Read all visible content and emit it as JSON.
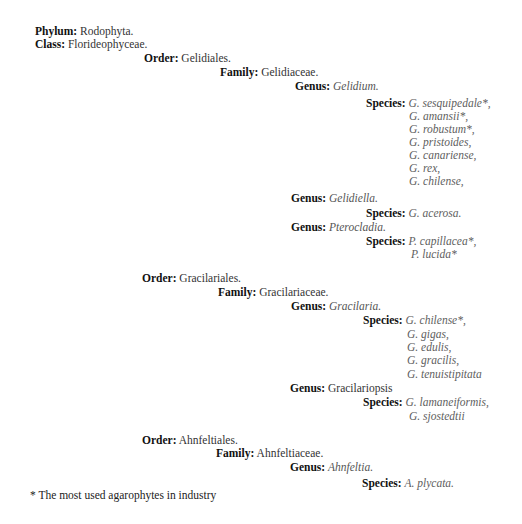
{
  "taxonomy": {
    "phylum": {
      "label": "Phylum:",
      "value": "Rodophyta."
    },
    "class": {
      "label": "Class:",
      "value": "Florideophyceae."
    },
    "orders": [
      {
        "label": "Order:",
        "value": "Gelidiales.",
        "family": {
          "label": "Family:",
          "value": "Gelidiaceae.",
          "genera": [
            {
              "label": "Genus:",
              "value": "Gelidium.",
              "species_label": "Species:",
              "species": [
                "G. sesquipedale*,",
                "G. amansii*,",
                "G. robustum*,",
                "G. pristoides,",
                "G. canariense,",
                "G. rex,",
                "G. chilense,"
              ]
            },
            {
              "label": "Genus:",
              "value": "Gelidiella.",
              "species_label": "Species:",
              "species": [
                "G. acerosa."
              ]
            },
            {
              "label": "Genus:",
              "value": "Pterocladia.",
              "species_label": "Species:",
              "species": [
                "P. capillacea*,",
                "P. lucida*"
              ]
            }
          ]
        }
      },
      {
        "label": "Order:",
        "value": "Gracilariales.",
        "family": {
          "label": "Family:",
          "value": "Gracilariaceae.",
          "genera": [
            {
              "label": "Genus:",
              "value": "Gracilaria.",
              "species_label": "Species:",
              "species": [
                "G. chilense*,",
                "G. gigas,",
                "G. edulis,",
                "G. gracilis,",
                "G. tenuistipitata"
              ]
            },
            {
              "label": "Genus:",
              "value": "Gracilariopsis",
              "species_label": "Species:",
              "species": [
                "G. lamaneiformis,",
                "G. sjostedtii"
              ]
            }
          ]
        }
      },
      {
        "label": "Order:",
        "value": "Ahnfeltiales.",
        "family": {
          "label": "Family:",
          "value": "Ahnfeltiaceae.",
          "genera": [
            {
              "label": "Genus:",
              "value": "Ahnfeltia.",
              "species_label": "Species:",
              "species": [
                "A. plycata."
              ]
            }
          ]
        }
      }
    ]
  },
  "footnote": "* The most used agarophytes in industry"
}
